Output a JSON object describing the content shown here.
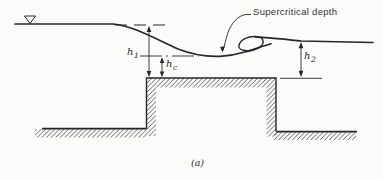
{
  "figure": {
    "caption": "(a)",
    "annotation": "Supercritical depth",
    "labels": {
      "h1": {
        "base": "h",
        "sub": "1"
      },
      "hc": {
        "base": "h",
        "sub": "c"
      },
      "h2": {
        "base": "h",
        "sub": "2"
      }
    },
    "colors": {
      "ink": "#2a2a2e",
      "hatch": "#3c3c40",
      "background": "#fbfbf9"
    }
  }
}
